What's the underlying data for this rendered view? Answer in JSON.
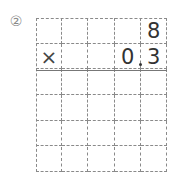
{
  "problem": {
    "number_label": "②",
    "operator": "×",
    "multiplicand": [
      "",
      "",
      "",
      "",
      "8"
    ],
    "multiplier": [
      "×",
      "",
      "",
      "0",
      "3"
    ],
    "decimal_point_after_column": 3,
    "grid": {
      "columns": 5,
      "rows": 6,
      "answer_rows": 4
    }
  }
}
